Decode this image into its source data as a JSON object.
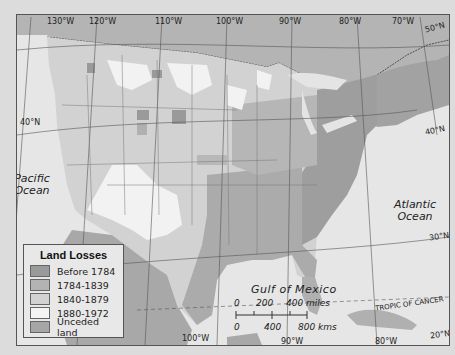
{
  "legend": {
    "title": "Land Losses",
    "items": [
      {
        "label": "Before 1784",
        "color": "#9a9a9a"
      },
      {
        "label": "1784-1839",
        "color": "#b3b3b3"
      },
      {
        "label": "1840-1879",
        "color": "#d2d2d2"
      },
      {
        "label": "1880-1972",
        "color": "#f4f4f4"
      },
      {
        "label": "Unceded land",
        "color": "#a6a6a6"
      }
    ]
  },
  "longitudes": {
    "top": [
      "130°W",
      "120°W",
      "110°W",
      "100°W",
      "90°W",
      "80°W",
      "70°W",
      "50°N"
    ],
    "bottom": [
      "100°W",
      "90°W",
      "80°W"
    ]
  },
  "latitudes": {
    "left": [
      "40°N"
    ],
    "right": [
      "40°N",
      "30°N",
      "20°N"
    ]
  },
  "water": {
    "pacific": [
      "Pacific",
      "Ocean"
    ],
    "atlantic": [
      "Atlantic",
      "Ocean"
    ],
    "gulf": "Gulf of Mexico",
    "tropic": "TROPIC OF CANCER"
  },
  "scale": {
    "miles_labels": [
      "0",
      "200",
      "400 miles"
    ],
    "km_labels": [
      "0",
      "400",
      "800 kms"
    ]
  }
}
